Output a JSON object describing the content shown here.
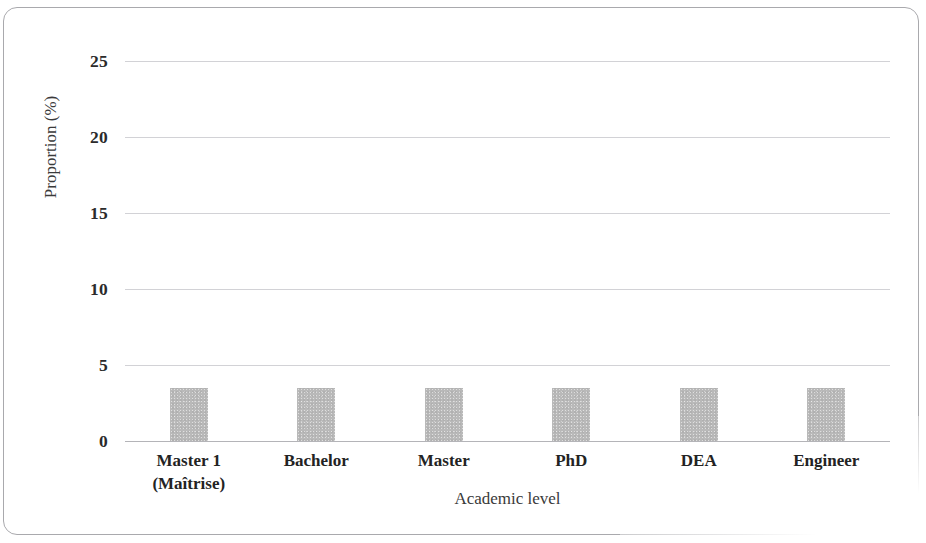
{
  "chart_data": {
    "type": "bar",
    "title": "",
    "xlabel": "Academic level",
    "ylabel": "Proportion (%)",
    "categories": [
      "Master 1\n(Maîtrise)",
      "Bachelor",
      "Master",
      "PhD",
      "DEA",
      "Engineer"
    ],
    "values": [
      3.5,
      3.5,
      3.5,
      3.5,
      3.5,
      3.5
    ],
    "ylim": [
      0,
      25
    ],
    "yticks": [
      "0",
      "5",
      "10",
      "15",
      "20",
      "25"
    ],
    "ytick_values": [
      0,
      5,
      10,
      15,
      20,
      25
    ],
    "grid": true,
    "legend": "none",
    "bar_color": "#b9b9b9",
    "gridline_color": "#d2d2d6",
    "axis_color": "#b4b4b8",
    "frame_color": "#a9a9ad"
  }
}
